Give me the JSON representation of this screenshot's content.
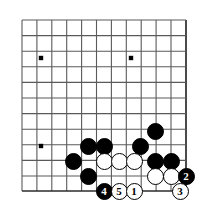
{
  "diagram": {
    "kind": "go-board-diagram",
    "board": {
      "background_color": "#ffffff",
      "line_color": "#5a5a5a",
      "edge_line_color": "#2b2b2b",
      "origin_x": 22,
      "origin_y": 20,
      "cell_width": 14.9,
      "cell_height": 15.6,
      "columns": 11,
      "rows": 11,
      "right_edge_x": 186,
      "bottom_edge_y": 191,
      "visible_edges": [
        "right",
        "bottom"
      ],
      "star_points": [
        {
          "x": 41,
          "y": 58
        },
        {
          "x": 131,
          "y": 58
        },
        {
          "x": 41,
          "y": 146
        }
      ]
    },
    "stone_colors": {
      "black_fill": "#000000",
      "white_fill": "#ffffff",
      "outline": "#000000",
      "black_label_color": "#ffffff",
      "white_label_color": "#000000"
    },
    "stone_diameter": 17,
    "stones": [
      {
        "id": "b1",
        "color": "black",
        "label": "",
        "x": 155,
        "y": 131
      },
      {
        "id": "b2",
        "color": "black",
        "label": "",
        "x": 88,
        "y": 146
      },
      {
        "id": "b3",
        "color": "black",
        "label": "",
        "x": 104,
        "y": 146
      },
      {
        "id": "b4",
        "color": "black",
        "label": "",
        "x": 140,
        "y": 146
      },
      {
        "id": "b5",
        "color": "black",
        "label": "",
        "x": 73,
        "y": 161
      },
      {
        "id": "w1",
        "color": "white",
        "label": "",
        "x": 104,
        "y": 161
      },
      {
        "id": "w2",
        "color": "white",
        "label": "",
        "x": 119,
        "y": 161
      },
      {
        "id": "w3",
        "color": "white",
        "label": "",
        "x": 134,
        "y": 161
      },
      {
        "id": "b6",
        "color": "black",
        "label": "",
        "x": 155,
        "y": 161
      },
      {
        "id": "b7",
        "color": "black",
        "label": "",
        "x": 171,
        "y": 161
      },
      {
        "id": "b8",
        "color": "black",
        "label": "",
        "x": 88,
        "y": 176
      },
      {
        "id": "w4",
        "color": "white",
        "label": "",
        "x": 155,
        "y": 176
      },
      {
        "id": "w5",
        "color": "white",
        "label": "",
        "x": 171,
        "y": 176
      },
      {
        "id": "m2",
        "color": "black",
        "label": "2",
        "x": 186,
        "y": 176
      },
      {
        "id": "m4",
        "color": "black",
        "label": "4",
        "x": 104,
        "y": 191
      },
      {
        "id": "m5",
        "color": "white",
        "label": "5",
        "x": 119,
        "y": 191
      },
      {
        "id": "m1",
        "color": "white",
        "label": "1",
        "x": 134,
        "y": 191
      },
      {
        "id": "m3",
        "color": "white",
        "label": "3",
        "x": 180,
        "y": 191
      }
    ],
    "move_numbers": [
      "1",
      "2",
      "3",
      "4",
      "5"
    ]
  }
}
